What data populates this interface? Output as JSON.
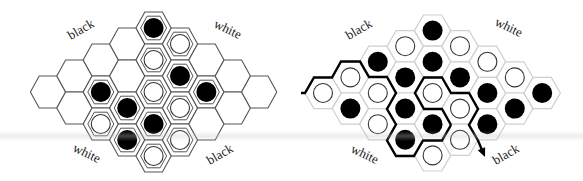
{
  "figure": {
    "colors": {
      "background": "#ffffff",
      "left_hex_stroke": "#555555",
      "right_hex_stroke": "#cfcfcf",
      "black_stone": "#000000",
      "white_stone_fill": "#ffffff",
      "white_stone_stroke": "#333333",
      "path": "#000000"
    }
  },
  "boards": [
    {
      "id": "left",
      "geometry": {
        "x0": 48,
        "y_mid": 92,
        "col_step": 26.4,
        "half_row": 16,
        "R": 17.6,
        "h": 16,
        "inner_R": 13,
        "inner_h": 11.8
      },
      "style": "outlined",
      "labels": [
        {
          "text": "black",
          "x": 83,
          "y": 33,
          "rotate": -30
        },
        {
          "text": "white",
          "x": 226,
          "y": 33,
          "rotate": 25
        },
        {
          "text": "white",
          "x": 85,
          "y": 157,
          "rotate": 25
        },
        {
          "text": "black",
          "x": 222,
          "y": 158,
          "rotate": -30
        }
      ],
      "stones": [
        {
          "col": 4,
          "row": 0,
          "color": "black"
        },
        {
          "col": 5,
          "row": 1,
          "color": "white"
        },
        {
          "col": 4,
          "row": 2,
          "color": "white"
        },
        {
          "col": 5,
          "row": 3,
          "color": "black"
        },
        {
          "col": 2,
          "row": 4,
          "color": "black"
        },
        {
          "col": 4,
          "row": 4,
          "color": "white"
        },
        {
          "col": 6,
          "row": 4,
          "color": "black"
        },
        {
          "col": 3,
          "row": 5,
          "color": "black"
        },
        {
          "col": 5,
          "row": 5,
          "color": "white"
        },
        {
          "col": 2,
          "row": 6,
          "color": "white"
        },
        {
          "col": 4,
          "row": 6,
          "color": "black"
        },
        {
          "col": 3,
          "row": 7,
          "color": "black"
        },
        {
          "col": 5,
          "row": 7,
          "color": "white"
        },
        {
          "col": 4,
          "row": 8,
          "color": "white"
        }
      ]
    },
    {
      "id": "right",
      "geometry": {
        "x0": 323,
        "y_mid": 93,
        "col_step": 27.4,
        "half_row": 15.6,
        "R": 18.2,
        "h": 15.6
      },
      "style": "filled",
      "labels": [
        {
          "text": "black",
          "x": 361,
          "y": 33,
          "rotate": -30
        },
        {
          "text": "white",
          "x": 507,
          "y": 31,
          "rotate": 25
        },
        {
          "text": "white",
          "x": 363,
          "y": 158,
          "rotate": 25
        },
        {
          "text": "black",
          "x": 508,
          "y": 158,
          "rotate": -30
        }
      ],
      "stones": [
        {
          "col": 0,
          "row": 4,
          "color": "white"
        },
        {
          "col": 1,
          "row": 3,
          "color": "white"
        },
        {
          "col": 1,
          "row": 5,
          "color": "black"
        },
        {
          "col": 2,
          "row": 2,
          "color": "black"
        },
        {
          "col": 2,
          "row": 4,
          "color": "white"
        },
        {
          "col": 2,
          "row": 6,
          "color": "white"
        },
        {
          "col": 3,
          "row": 1,
          "color": "white"
        },
        {
          "col": 3,
          "row": 3,
          "color": "black"
        },
        {
          "col": 3,
          "row": 5,
          "color": "black"
        },
        {
          "col": 3,
          "row": 7,
          "color": "black"
        },
        {
          "col": 4,
          "row": 0,
          "color": "black"
        },
        {
          "col": 4,
          "row": 2,
          "color": "black"
        },
        {
          "col": 4,
          "row": 4,
          "color": "white"
        },
        {
          "col": 4,
          "row": 6,
          "color": "black"
        },
        {
          "col": 4,
          "row": 8,
          "color": "white"
        },
        {
          "col": 5,
          "row": 1,
          "color": "white"
        },
        {
          "col": 5,
          "row": 3,
          "color": "black"
        },
        {
          "col": 5,
          "row": 5,
          "color": "white"
        },
        {
          "col": 5,
          "row": 7,
          "color": "white"
        },
        {
          "col": 6,
          "row": 2,
          "color": "white"
        },
        {
          "col": 6,
          "row": 4,
          "color": "black"
        },
        {
          "col": 6,
          "row": 6,
          "color": "black"
        },
        {
          "col": 7,
          "row": 3,
          "color": "white"
        },
        {
          "col": 7,
          "row": 5,
          "color": "black"
        },
        {
          "col": 8,
          "row": 4,
          "color": "black"
        }
      ],
      "path": {
        "main": [
          [
            301,
            93
          ],
          [
            305,
            93
          ],
          [
            314,
            77.5
          ],
          [
            332,
            77.5
          ],
          [
            341,
            61.5
          ],
          [
            360,
            61.5
          ],
          [
            369,
            77
          ],
          [
            387,
            77
          ],
          [
            396,
            93
          ],
          [
            387,
            109
          ],
          [
            396,
            124.5
          ],
          [
            387,
            140.5
          ],
          [
            396,
            156
          ],
          [
            414,
            156
          ],
          [
            423,
            140.5
          ],
          [
            442,
            140.5
          ],
          [
            451,
            125
          ]
        ],
        "loop": [
          [
            451,
            125
          ],
          [
            442,
            109
          ],
          [
            424,
            109
          ],
          [
            415,
            93
          ],
          [
            424,
            77.5
          ],
          [
            442,
            77.5
          ],
          [
            451,
            93
          ],
          [
            469,
            93
          ],
          [
            478,
            109
          ],
          [
            469,
            125
          ],
          [
            478,
            140.5
          ],
          [
            482,
            150
          ]
        ],
        "arrow_tip": [
          485,
          157
        ]
      }
    }
  ]
}
